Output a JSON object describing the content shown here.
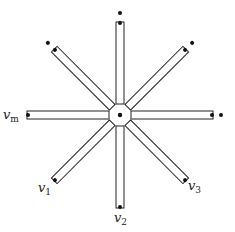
{
  "diagram": {
    "center": {
      "x": 120,
      "y": 115
    },
    "colors": {
      "stroke": "#222222",
      "dot": "#111111",
      "background": "#ffffff"
    },
    "arms": [
      {
        "id": "arm-top",
        "angle": -90,
        "label": null,
        "extra_dot": true
      },
      {
        "id": "arm-top-right",
        "angle": -45,
        "label": null,
        "extra_dot": true
      },
      {
        "id": "arm-right",
        "angle": 0,
        "label": null,
        "extra_dot": true
      },
      {
        "id": "arm-bottom-right",
        "angle": 45,
        "label": "v3",
        "extra_dot": false
      },
      {
        "id": "arm-bottom",
        "angle": 90,
        "label": "v2",
        "extra_dot": false
      },
      {
        "id": "arm-bottom-left",
        "angle": 135,
        "label": "v1",
        "extra_dot": false
      },
      {
        "id": "arm-left",
        "angle": 180,
        "label": "vm",
        "extra_dot": false
      },
      {
        "id": "arm-top-left",
        "angle": -135,
        "label": null,
        "extra_dot": true
      }
    ],
    "labels": {
      "v1": {
        "base": "v",
        "sub": "1"
      },
      "v2": {
        "base": "v",
        "sub": "2"
      },
      "v3": {
        "base": "v",
        "sub": "3"
      },
      "vm": {
        "base": "v",
        "sub": "m"
      }
    }
  }
}
